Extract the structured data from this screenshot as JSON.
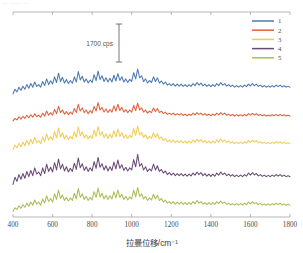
{
  "figure": {
    "top_cropped_artifact": "— —— —",
    "background_color": "#ffffff",
    "axis_color": "#9a9a9a"
  },
  "annotation": {
    "scale_label": "1700 cps",
    "scale_bar_name": "intensity-scale-bar"
  },
  "legend": {
    "position": "top-right",
    "items": [
      {
        "label": "1",
        "color": "#4c79b0"
      },
      {
        "label": "2",
        "color": "#e0603c"
      },
      {
        "label": "3",
        "color": "#f2cc55"
      },
      {
        "label": "4",
        "color": "#6b4a78"
      },
      {
        "label": "5",
        "color": "#a8bf53"
      }
    ]
  },
  "chart_data": {
    "type": "line",
    "title": "",
    "xlabel": "拉曼位移/cm⁻¹",
    "ylabel": "",
    "xlim": [
      400,
      1800
    ],
    "xticks": [
      400,
      600,
      800,
      1000,
      1200,
      1400,
      1600,
      1800
    ],
    "xtick_labels": [
      "400",
      "600",
      "800",
      "1000",
      "1200",
      "1400",
      "1600",
      "1800"
    ],
    "yticks": [],
    "ytick_labels": [],
    "grid": false,
    "legend_position": "upper right",
    "y_scale_bar": {
      "value": 1700,
      "units": "cps",
      "label": "1700 cps"
    },
    "offset_stacked": true,
    "note": "Five vertically offset Raman spectra; y axis hidden, intensity indicated by 1700 cps scale bar",
    "x": [
      400,
      410,
      420,
      430,
      440,
      450,
      460,
      470,
      480,
      490,
      500,
      510,
      520,
      530,
      540,
      550,
      560,
      570,
      580,
      590,
      600,
      610,
      620,
      630,
      640,
      650,
      660,
      670,
      680,
      690,
      700,
      710,
      720,
      730,
      740,
      750,
      760,
      770,
      780,
      790,
      800,
      810,
      820,
      830,
      840,
      850,
      860,
      870,
      880,
      890,
      900,
      910,
      920,
      930,
      940,
      950,
      960,
      970,
      980,
      990,
      1000,
      1010,
      1020,
      1030,
      1040,
      1050,
      1060,
      1070,
      1080,
      1090,
      1100,
      1110,
      1120,
      1130,
      1140,
      1150,
      1160,
      1170,
      1180,
      1190,
      1200,
      1210,
      1220,
      1230,
      1240,
      1250,
      1260,
      1270,
      1280,
      1290,
      1300,
      1310,
      1320,
      1330,
      1340,
      1350,
      1360,
      1370,
      1380,
      1390,
      1400,
      1410,
      1420,
      1430,
      1440,
      1450,
      1460,
      1470,
      1480,
      1490,
      1500,
      1510,
      1520,
      1530,
      1540,
      1550,
      1560,
      1570,
      1580,
      1590,
      1600,
      1610,
      1620,
      1630,
      1640,
      1650,
      1660,
      1670,
      1680,
      1690,
      1700,
      1710,
      1720,
      1730,
      1740,
      1750,
      1760,
      1770,
      1780,
      1790,
      1800
    ],
    "series": [
      {
        "name": "1",
        "color": "#4c79b0",
        "offset": 0,
        "values": [
          0.05,
          0.22,
          0.12,
          0.3,
          0.18,
          0.34,
          0.22,
          0.4,
          0.26,
          0.44,
          0.3,
          0.5,
          0.33,
          0.4,
          0.3,
          0.52,
          0.36,
          0.62,
          0.4,
          0.55,
          0.42,
          0.7,
          0.48,
          0.84,
          0.52,
          0.68,
          0.46,
          0.6,
          0.44,
          0.56,
          0.45,
          0.7,
          0.5,
          0.9,
          0.58,
          0.72,
          0.5,
          0.62,
          0.46,
          0.58,
          0.48,
          0.78,
          0.55,
          0.92,
          0.6,
          0.74,
          0.52,
          0.66,
          0.5,
          0.64,
          0.5,
          0.76,
          0.54,
          0.82,
          0.56,
          0.7,
          0.5,
          0.62,
          0.48,
          0.6,
          0.52,
          0.86,
          0.62,
          1.0,
          0.66,
          0.74,
          0.52,
          0.62,
          0.46,
          0.56,
          0.48,
          0.7,
          0.52,
          0.66,
          0.46,
          0.54,
          0.42,
          0.5,
          0.38,
          0.44,
          0.36,
          0.44,
          0.34,
          0.42,
          0.34,
          0.42,
          0.33,
          0.4,
          0.32,
          0.4,
          0.33,
          0.44,
          0.36,
          0.48,
          0.38,
          0.46,
          0.35,
          0.42,
          0.33,
          0.4,
          0.32,
          0.4,
          0.33,
          0.44,
          0.36,
          0.48,
          0.38,
          0.44,
          0.34,
          0.4,
          0.32,
          0.38,
          0.3,
          0.36,
          0.3,
          0.36,
          0.3,
          0.38,
          0.32,
          0.42,
          0.35,
          0.44,
          0.36,
          0.42,
          0.33,
          0.38,
          0.31,
          0.36,
          0.3,
          0.35,
          0.3,
          0.36,
          0.31,
          0.38,
          0.32,
          0.38,
          0.31,
          0.36,
          0.3,
          0.34,
          0.3
        ]
      },
      {
        "name": "2",
        "color": "#e0603c",
        "offset": 1,
        "values": [
          0.08,
          0.18,
          0.12,
          0.24,
          0.15,
          0.26,
          0.18,
          0.3,
          0.2,
          0.32,
          0.22,
          0.36,
          0.24,
          0.3,
          0.22,
          0.38,
          0.26,
          0.46,
          0.3,
          0.4,
          0.3,
          0.52,
          0.36,
          0.64,
          0.4,
          0.5,
          0.34,
          0.44,
          0.32,
          0.42,
          0.34,
          0.56,
          0.4,
          0.72,
          0.46,
          0.58,
          0.4,
          0.5,
          0.36,
          0.48,
          0.38,
          0.64,
          0.46,
          0.78,
          0.5,
          0.6,
          0.42,
          0.54,
          0.4,
          0.52,
          0.42,
          0.66,
          0.46,
          0.72,
          0.48,
          0.6,
          0.42,
          0.52,
          0.4,
          0.5,
          0.42,
          0.68,
          0.48,
          0.76,
          0.5,
          0.58,
          0.42,
          0.5,
          0.38,
          0.46,
          0.4,
          0.58,
          0.44,
          0.56,
          0.4,
          0.46,
          0.36,
          0.42,
          0.33,
          0.38,
          0.32,
          0.38,
          0.3,
          0.36,
          0.3,
          0.36,
          0.29,
          0.34,
          0.28,
          0.34,
          0.29,
          0.38,
          0.31,
          0.4,
          0.33,
          0.38,
          0.3,
          0.36,
          0.29,
          0.34,
          0.28,
          0.34,
          0.29,
          0.38,
          0.31,
          0.4,
          0.32,
          0.38,
          0.3,
          0.34,
          0.28,
          0.33,
          0.27,
          0.32,
          0.27,
          0.32,
          0.27,
          0.33,
          0.28,
          0.36,
          0.3,
          0.37,
          0.31,
          0.36,
          0.29,
          0.33,
          0.28,
          0.32,
          0.27,
          0.31,
          0.27,
          0.32,
          0.28,
          0.33,
          0.28,
          0.33,
          0.28,
          0.32,
          0.27,
          0.3,
          0.27
        ]
      },
      {
        "name": "3",
        "color": "#f2cc55",
        "offset": 2,
        "values": [
          0.1,
          0.26,
          0.16,
          0.34,
          0.2,
          0.38,
          0.24,
          0.44,
          0.28,
          0.48,
          0.32,
          0.56,
          0.36,
          0.44,
          0.32,
          0.58,
          0.4,
          0.7,
          0.46,
          0.6,
          0.46,
          0.78,
          0.54,
          0.92,
          0.58,
          0.74,
          0.5,
          0.64,
          0.48,
          0.6,
          0.5,
          0.78,
          0.56,
          0.96,
          0.62,
          0.78,
          0.54,
          0.66,
          0.5,
          0.62,
          0.52,
          0.84,
          0.6,
          0.98,
          0.64,
          0.78,
          0.56,
          0.7,
          0.52,
          0.68,
          0.54,
          0.82,
          0.58,
          0.88,
          0.6,
          0.74,
          0.54,
          0.66,
          0.52,
          0.64,
          0.56,
          0.9,
          0.64,
          1.0,
          0.66,
          0.76,
          0.56,
          0.66,
          0.5,
          0.6,
          0.52,
          0.74,
          0.56,
          0.7,
          0.5,
          0.58,
          0.44,
          0.52,
          0.4,
          0.46,
          0.38,
          0.46,
          0.36,
          0.44,
          0.36,
          0.44,
          0.35,
          0.42,
          0.34,
          0.42,
          0.35,
          0.46,
          0.38,
          0.5,
          0.4,
          0.48,
          0.37,
          0.44,
          0.35,
          0.42,
          0.34,
          0.42,
          0.35,
          0.46,
          0.38,
          0.5,
          0.4,
          0.46,
          0.36,
          0.42,
          0.34,
          0.4,
          0.32,
          0.38,
          0.32,
          0.38,
          0.32,
          0.4,
          0.34,
          0.44,
          0.37,
          0.46,
          0.38,
          0.44,
          0.35,
          0.4,
          0.33,
          0.38,
          0.32,
          0.37,
          0.32,
          0.38,
          0.33,
          0.4,
          0.34,
          0.4,
          0.33,
          0.38,
          0.32,
          0.36,
          0.32
        ]
      },
      {
        "name": "4",
        "color": "#6b4a78",
        "offset": 3,
        "values": [
          0.02,
          0.3,
          0.14,
          0.4,
          0.22,
          0.44,
          0.26,
          0.52,
          0.32,
          0.56,
          0.36,
          0.66,
          0.42,
          0.5,
          0.36,
          0.66,
          0.44,
          0.8,
          0.52,
          0.68,
          0.5,
          0.86,
          0.58,
          1.0,
          0.62,
          0.8,
          0.54,
          0.7,
          0.5,
          0.64,
          0.52,
          0.84,
          0.6,
          1.04,
          0.66,
          0.82,
          0.56,
          0.7,
          0.52,
          0.66,
          0.54,
          0.9,
          0.64,
          1.06,
          0.68,
          0.82,
          0.58,
          0.74,
          0.54,
          0.7,
          0.56,
          0.88,
          0.62,
          0.96,
          0.64,
          0.78,
          0.56,
          0.68,
          0.54,
          0.66,
          0.58,
          0.98,
          0.7,
          1.18,
          0.72,
          0.82,
          0.58,
          0.7,
          0.52,
          0.62,
          0.54,
          0.8,
          0.58,
          0.74,
          0.52,
          0.6,
          0.46,
          0.54,
          0.4,
          0.48,
          0.38,
          0.46,
          0.36,
          0.44,
          0.36,
          0.44,
          0.35,
          0.42,
          0.34,
          0.42,
          0.35,
          0.46,
          0.38,
          0.5,
          0.4,
          0.48,
          0.36,
          0.44,
          0.34,
          0.42,
          0.33,
          0.42,
          0.34,
          0.46,
          0.38,
          0.5,
          0.4,
          0.46,
          0.36,
          0.42,
          0.34,
          0.4,
          0.32,
          0.38,
          0.32,
          0.38,
          0.32,
          0.4,
          0.34,
          0.46,
          0.38,
          0.48,
          0.39,
          0.44,
          0.35,
          0.4,
          0.33,
          0.38,
          0.32,
          0.37,
          0.32,
          0.38,
          0.33,
          0.4,
          0.34,
          0.4,
          0.33,
          0.38,
          0.32,
          0.36,
          0.32
        ]
      },
      {
        "name": "5",
        "color": "#a8bf53",
        "offset": 4,
        "values": [
          0.06,
          0.2,
          0.14,
          0.28,
          0.18,
          0.32,
          0.22,
          0.38,
          0.26,
          0.42,
          0.3,
          0.5,
          0.34,
          0.42,
          0.3,
          0.54,
          0.38,
          0.66,
          0.44,
          0.56,
          0.42,
          0.74,
          0.52,
          0.88,
          0.56,
          0.7,
          0.48,
          0.6,
          0.46,
          0.58,
          0.48,
          0.76,
          0.54,
          0.94,
          0.6,
          0.74,
          0.52,
          0.64,
          0.48,
          0.6,
          0.5,
          0.82,
          0.6,
          0.96,
          0.62,
          0.76,
          0.54,
          0.68,
          0.52,
          0.66,
          0.54,
          0.82,
          0.58,
          0.88,
          0.6,
          0.72,
          0.52,
          0.64,
          0.5,
          0.62,
          0.54,
          0.88,
          0.62,
          0.98,
          0.64,
          0.74,
          0.54,
          0.64,
          0.48,
          0.58,
          0.5,
          0.72,
          0.54,
          0.68,
          0.48,
          0.56,
          0.42,
          0.5,
          0.38,
          0.44,
          0.36,
          0.44,
          0.34,
          0.42,
          0.34,
          0.42,
          0.33,
          0.4,
          0.32,
          0.4,
          0.33,
          0.44,
          0.36,
          0.48,
          0.38,
          0.44,
          0.34,
          0.4,
          0.32,
          0.4,
          0.32,
          0.4,
          0.33,
          0.44,
          0.36,
          0.46,
          0.37,
          0.42,
          0.33,
          0.38,
          0.31,
          0.36,
          0.3,
          0.36,
          0.3,
          0.36,
          0.3,
          0.38,
          0.32,
          0.42,
          0.35,
          0.44,
          0.36,
          0.4,
          0.32,
          0.37,
          0.31,
          0.35,
          0.3,
          0.35,
          0.3,
          0.36,
          0.31,
          0.38,
          0.32,
          0.38,
          0.31,
          0.35,
          0.3,
          0.34,
          0.3
        ]
      }
    ]
  }
}
